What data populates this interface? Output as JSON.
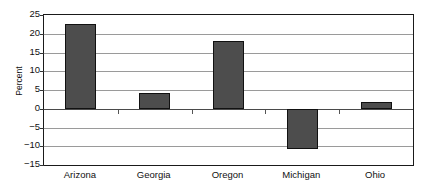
{
  "chart_data": {
    "type": "bar",
    "title": "",
    "xlabel": "",
    "ylabel": "Percent",
    "categories": [
      "Arizona",
      "Georgia",
      "Oregon",
      "Michigan",
      "Ohio"
    ],
    "values": [
      22.5,
      4.3,
      18.0,
      -10.8,
      1.8
    ],
    "ylim": [
      -15,
      25
    ],
    "ytick_values": [
      25,
      20,
      15,
      10,
      5,
      0,
      -5,
      -10,
      -15
    ],
    "ytick_labels": [
      "25",
      "20",
      "15",
      "10",
      "5",
      "0",
      "−5",
      "−10",
      "−15"
    ],
    "grid": true,
    "legend": false,
    "bar_color": "#4d4d4d",
    "bar_border_color": "#111111",
    "grid_color": "#9a9a9a",
    "axis_color": "#1a1a1a",
    "background": "#ffffff"
  }
}
